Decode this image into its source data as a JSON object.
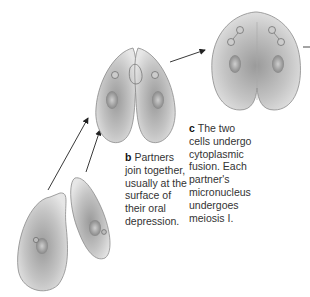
{
  "diagram": {
    "steps": [
      {
        "letter": "b",
        "lines": [
          "Partners",
          "join together,",
          "usually at the",
          "surface of",
          "their oral",
          "depression."
        ]
      },
      {
        "letter": "c",
        "lines": [
          "The two",
          "cells undergo",
          "cytoplasmic",
          "fusion. Each",
          "partner's",
          "micronucleus",
          "undergoes",
          "meiosis I."
        ]
      }
    ],
    "colors": {
      "cell_fill": "#c9c9c9",
      "cell_edge": "#8a8a8a",
      "text": "#333333",
      "arrow": "#222222"
    }
  }
}
